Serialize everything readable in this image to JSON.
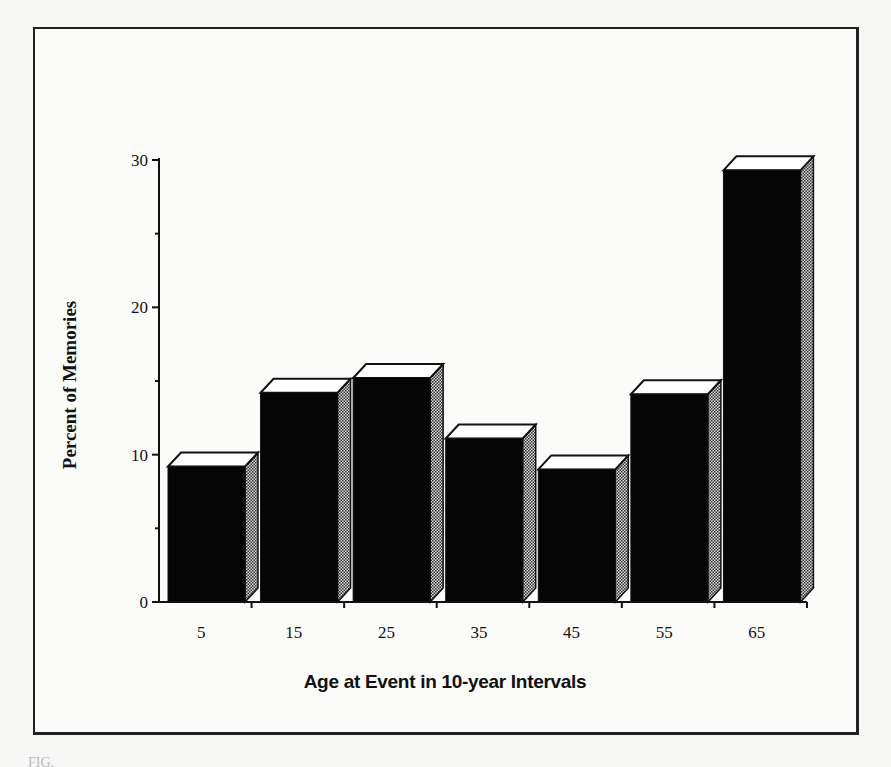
{
  "figure": {
    "caption_fragment": "FIG."
  },
  "chart_data": {
    "type": "bar",
    "style": "3d-bars",
    "title": "",
    "xlabel": "Age at Event in 10-year Intervals",
    "ylabel": "Percent of Memories",
    "categories": [
      "5",
      "15",
      "25",
      "35",
      "45",
      "55",
      "65"
    ],
    "values": [
      9.2,
      14.2,
      15.2,
      11.1,
      9.0,
      14.1,
      29.3
    ],
    "ylim": [
      0,
      30
    ],
    "yticks_major": [
      0,
      10,
      20,
      30
    ],
    "yticks_minor": [
      5,
      15,
      25
    ],
    "grid": false,
    "legend": null,
    "colors": {
      "bar_front": "#050505",
      "bar_top": "#ffffff",
      "bar_side": "#8a8a8a",
      "axis": "#111111"
    }
  }
}
